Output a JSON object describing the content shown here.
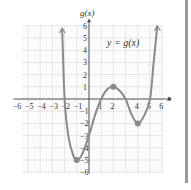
{
  "chart_data": {
    "type": "line",
    "title": "",
    "annotation": "y = g(x)",
    "xlabel": "x",
    "ylabel": "g(x)",
    "xlim": [
      -6,
      6
    ],
    "ylim": [
      -6,
      6
    ],
    "grid": true,
    "x_ticks": [
      "−6",
      "−5",
      "−4",
      "−3",
      "−2",
      "−1",
      "1",
      "2",
      "4",
      "5",
      "6"
    ],
    "y_ticks": [
      "6",
      "5",
      "4",
      "3",
      "2",
      "1",
      "−1",
      "−2",
      "−3",
      "−4",
      "−5",
      "−6"
    ],
    "key_points": [
      {
        "x": -1,
        "y": -5,
        "label": "local minimum"
      },
      {
        "x": 2,
        "y": 1,
        "label": "local maximum"
      },
      {
        "x": 4,
        "y": -2,
        "label": "local minimum"
      }
    ],
    "x_intercepts": [
      -2,
      1,
      3,
      5
    ],
    "y_intercept": -3,
    "series": [
      {
        "name": "g(x)",
        "color": "#8a8a8a",
        "points": [
          [
            -2.2,
            5.8
          ],
          [
            -2,
            0
          ],
          [
            -1.7,
            -3
          ],
          [
            -1.3,
            -4.6
          ],
          [
            -1,
            -5
          ],
          [
            -0.6,
            -4.6
          ],
          [
            0,
            -3
          ],
          [
            0.5,
            -1.3
          ],
          [
            1,
            0
          ],
          [
            1.5,
            0.8
          ],
          [
            2,
            1
          ],
          [
            2.5,
            0.7
          ],
          [
            3,
            0
          ],
          [
            3.5,
            -1.3
          ],
          [
            4,
            -2
          ],
          [
            4.5,
            -1.4
          ],
          [
            5,
            0
          ],
          [
            5.3,
            3
          ],
          [
            5.6,
            6
          ]
        ]
      }
    ]
  },
  "labels": {
    "ylabel": "g(x)",
    "xlabel": "x",
    "equation": "y = g(x)"
  }
}
